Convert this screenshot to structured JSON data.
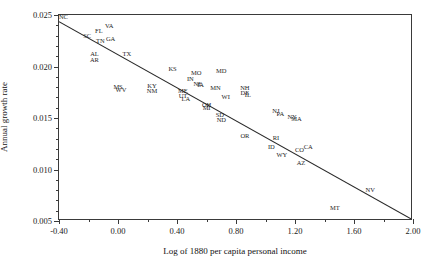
{
  "chart_data": {
    "type": "scatter",
    "title": "",
    "xlabel": "Log of 1880 per capita personal income",
    "ylabel": "Annual growth rate",
    "xlim": [
      -0.4,
      2.0
    ],
    "ylim": [
      0.005,
      0.025
    ],
    "xticks": [
      "-0.40",
      "0.00",
      "0.40",
      "0.80",
      "1.20",
      "1.60",
      "2.00"
    ],
    "xtick_values": [
      -0.4,
      0.0,
      0.4,
      0.8,
      1.2,
      1.6,
      2.0
    ],
    "xminor_values": [
      -0.2,
      0.2,
      0.6,
      1.0,
      1.4,
      1.8
    ],
    "yticks": [
      "0.005",
      "0.010",
      "0.015",
      "0.020",
      "0.025"
    ],
    "ytick_values": [
      0.005,
      0.01,
      0.015,
      0.02,
      0.025
    ],
    "yminor_values": [
      0.006,
      0.007,
      0.008,
      0.009,
      0.011,
      0.012,
      0.013,
      0.014,
      0.016,
      0.017,
      0.018,
      0.019,
      0.021,
      0.022,
      0.023,
      0.024
    ],
    "grid": false,
    "legend": "none",
    "point_label_field": "state",
    "fit_line": {
      "type": "linear",
      "x0": -0.4,
      "y0": 0.02435,
      "x1": 2.0,
      "y1": 0.0051
    },
    "points": [
      {
        "state": "NC",
        "x": -0.37,
        "y": 0.0248
      },
      {
        "state": "SC",
        "x": -0.21,
        "y": 0.02295
      },
      {
        "state": "FL",
        "x": -0.13,
        "y": 0.02345
      },
      {
        "state": "VA",
        "x": -0.06,
        "y": 0.02395
      },
      {
        "state": "TN",
        "x": -0.12,
        "y": 0.0225
      },
      {
        "state": "GA",
        "x": -0.05,
        "y": 0.02265
      },
      {
        "state": "AL",
        "x": -0.16,
        "y": 0.0212
      },
      {
        "state": "AR",
        "x": -0.16,
        "y": 0.02065
      },
      {
        "state": "TX",
        "x": 0.06,
        "y": 0.0212
      },
      {
        "state": "KS",
        "x": 0.37,
        "y": 0.01975
      },
      {
        "state": "MO",
        "x": 0.53,
        "y": 0.01935
      },
      {
        "state": "MD",
        "x": 0.7,
        "y": 0.01955
      },
      {
        "state": "IN",
        "x": 0.49,
        "y": 0.01875
      },
      {
        "state": "NE",
        "x": 0.54,
        "y": 0.0183
      },
      {
        "state": "IA",
        "x": 0.56,
        "y": 0.0182
      },
      {
        "state": "MS",
        "x": 0.0,
        "y": 0.018
      },
      {
        "state": "WV",
        "x": 0.02,
        "y": 0.01775
      },
      {
        "state": "KY",
        "x": 0.23,
        "y": 0.0181
      },
      {
        "state": "NM",
        "x": 0.23,
        "y": 0.0176
      },
      {
        "state": "ME",
        "x": 0.44,
        "y": 0.01765
      },
      {
        "state": "UT",
        "x": 0.44,
        "y": 0.01715
      },
      {
        "state": "LA",
        "x": 0.46,
        "y": 0.0168
      },
      {
        "state": "MN",
        "x": 0.66,
        "y": 0.0179
      },
      {
        "state": "NH",
        "x": 0.86,
        "y": 0.01795
      },
      {
        "state": "DE",
        "x": 0.86,
        "y": 0.0174
      },
      {
        "state": "IL",
        "x": 0.88,
        "y": 0.0172
      },
      {
        "state": "WI",
        "x": 0.73,
        "y": 0.01705
      },
      {
        "state": "OH",
        "x": 0.6,
        "y": 0.0163
      },
      {
        "state": "MI",
        "x": 0.6,
        "y": 0.016
      },
      {
        "state": "SD",
        "x": 0.69,
        "y": 0.0153
      },
      {
        "state": "ND",
        "x": 0.7,
        "y": 0.0148
      },
      {
        "state": "NJ",
        "x": 1.07,
        "y": 0.0157
      },
      {
        "state": "PA",
        "x": 1.1,
        "y": 0.0154
      },
      {
        "state": "NY",
        "x": 1.18,
        "y": 0.01505
      },
      {
        "state": "MA",
        "x": 1.21,
        "y": 0.0149
      },
      {
        "state": "OR",
        "x": 0.86,
        "y": 0.0133
      },
      {
        "state": "RI",
        "x": 1.07,
        "y": 0.0131
      },
      {
        "state": "ID",
        "x": 1.04,
        "y": 0.01215
      },
      {
        "state": "CO",
        "x": 1.23,
        "y": 0.01185
      },
      {
        "state": "CA",
        "x": 1.29,
        "y": 0.01215
      },
      {
        "state": "WY",
        "x": 1.11,
        "y": 0.0114
      },
      {
        "state": "AZ",
        "x": 1.24,
        "y": 0.0106
      },
      {
        "state": "NV",
        "x": 1.71,
        "y": 0.008
      },
      {
        "state": "MT",
        "x": 1.47,
        "y": 0.00625
      }
    ]
  }
}
